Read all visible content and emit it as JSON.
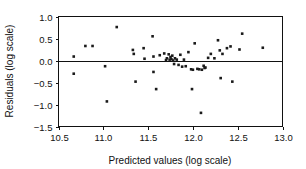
{
  "chart_data": {
    "type": "scatter",
    "title": "",
    "xlabel": "Predicted values (log scale)",
    "ylabel": "Residuals (log scale)",
    "xlim": [
      10.5,
      13.0
    ],
    "ylim": [
      -1.5,
      1.0
    ],
    "xticks": [
      10.5,
      11.0,
      11.5,
      12.0,
      12.5,
      13.0
    ],
    "yticks": [
      1.0,
      0.5,
      0.0,
      -0.5,
      -1.0,
      -1.5
    ],
    "xticklabels": [
      "10.5",
      "11.0",
      "11.5",
      "12.0",
      "12.5",
      "13.0"
    ],
    "yticklabels": [
      "1.0",
      "0.5",
      "0.0",
      "−0.5",
      "−1.0",
      "−1.5"
    ],
    "grid": false,
    "legend": null,
    "reference_lines": [
      {
        "orientation": "horizontal",
        "value": 0.0,
        "name": "zero-residual-line"
      }
    ],
    "marker": {
      "shape": "square",
      "size": 2.6,
      "color": "#1a1a1a"
    },
    "point_count": 60,
    "points": [
      {
        "x": 10.67,
        "y": 0.09
      },
      {
        "x": 10.67,
        "y": -0.3
      },
      {
        "x": 10.8,
        "y": 0.33
      },
      {
        "x": 10.88,
        "y": 0.33
      },
      {
        "x": 11.02,
        "y": -0.13
      },
      {
        "x": 11.04,
        "y": -0.93
      },
      {
        "x": 11.15,
        "y": 0.76
      },
      {
        "x": 11.33,
        "y": 0.24
      },
      {
        "x": 11.34,
        "y": 0.15
      },
      {
        "x": 11.36,
        "y": -0.48
      },
      {
        "x": 11.45,
        "y": 0.28
      },
      {
        "x": 11.46,
        "y": 0.04
      },
      {
        "x": 11.55,
        "y": 0.55
      },
      {
        "x": 11.56,
        "y": 0.09
      },
      {
        "x": 11.56,
        "y": -0.26
      },
      {
        "x": 11.59,
        "y": -0.65
      },
      {
        "x": 11.63,
        "y": 0.12
      },
      {
        "x": 11.68,
        "y": 0.16
      },
      {
        "x": 11.7,
        "y": 0.01
      },
      {
        "x": 11.71,
        "y": 0.05
      },
      {
        "x": 11.73,
        "y": 0.14
      },
      {
        "x": 11.74,
        "y": 0.02
      },
      {
        "x": 11.75,
        "y": 0.08
      },
      {
        "x": 11.76,
        "y": 0.03
      },
      {
        "x": 11.77,
        "y": 0.11
      },
      {
        "x": 11.78,
        "y": 0.0
      },
      {
        "x": 11.79,
        "y": -0.08
      },
      {
        "x": 11.8,
        "y": 0.05
      },
      {
        "x": 11.82,
        "y": 0.02
      },
      {
        "x": 11.84,
        "y": -0.1
      },
      {
        "x": 11.86,
        "y": 0.13
      },
      {
        "x": 11.88,
        "y": -0.14
      },
      {
        "x": 11.9,
        "y": 0.02
      },
      {
        "x": 11.92,
        "y": -0.13
      },
      {
        "x": 11.95,
        "y": 0.19
      },
      {
        "x": 11.98,
        "y": -0.2
      },
      {
        "x": 11.99,
        "y": -0.65
      },
      {
        "x": 12.0,
        "y": -0.21
      },
      {
        "x": 12.02,
        "y": 0.39
      },
      {
        "x": 12.05,
        "y": -0.19
      },
      {
        "x": 12.07,
        "y": -0.2
      },
      {
        "x": 12.09,
        "y": -1.19
      },
      {
        "x": 12.1,
        "y": -0.21
      },
      {
        "x": 12.12,
        "y": -0.12
      },
      {
        "x": 12.13,
        "y": -0.17
      },
      {
        "x": 12.14,
        "y": -0.16
      },
      {
        "x": 12.17,
        "y": 0.06
      },
      {
        "x": 12.2,
        "y": 0.15
      },
      {
        "x": 12.24,
        "y": 0.05
      },
      {
        "x": 12.28,
        "y": 0.46
      },
      {
        "x": 12.3,
        "y": 0.23
      },
      {
        "x": 12.31,
        "y": -0.4
      },
      {
        "x": 12.33,
        "y": 0.15
      },
      {
        "x": 12.38,
        "y": 0.28
      },
      {
        "x": 12.42,
        "y": 0.32
      },
      {
        "x": 12.44,
        "y": -0.48
      },
      {
        "x": 12.52,
        "y": 0.25
      },
      {
        "x": 12.55,
        "y": 0.61
      },
      {
        "x": 12.78,
        "y": 0.29
      }
    ]
  },
  "figure": {
    "background": "#ffffff",
    "axis_color": "#111111",
    "marker_color": "#1a1a1a"
  }
}
